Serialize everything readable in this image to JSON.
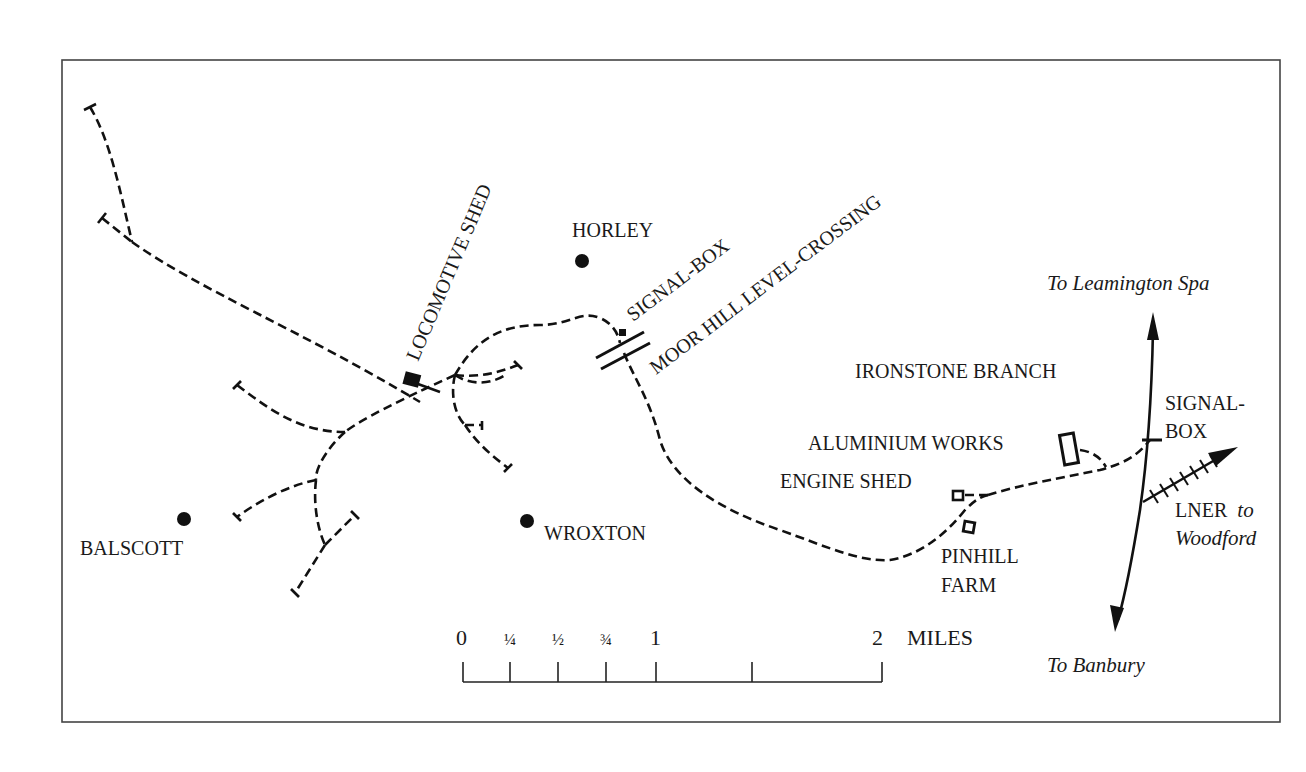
{
  "map": {
    "title_area": "IRONSTONE BRANCH",
    "places": [
      {
        "name": "HORLEY",
        "type": "village"
      },
      {
        "name": "BALSCOTT",
        "type": "village"
      },
      {
        "name": "WROXTON",
        "type": "village"
      }
    ],
    "features": {
      "locomotive_shed": "LOCOMOTIVE SHED",
      "signal_box_moor_hill": "SIGNAL-BOX",
      "level_crossing": "MOOR HILL LEVEL-CROSSING",
      "aluminium_works": "ALUMINIUM WORKS",
      "engine_shed": "ENGINE SHED",
      "pinhill_farm_line1": "PINHILL",
      "pinhill_farm_line2": "FARM",
      "signal_box_junction_line1": "SIGNAL-",
      "signal_box_junction_line2": "BOX"
    },
    "directions": {
      "north": "To Leamington Spa",
      "south": "To Banbury",
      "lner_line1_prefix": "LNER",
      "lner_line1_italic": "to",
      "lner_line2": "Woodford"
    },
    "scale_bar": {
      "unit": "MILES",
      "ticks": [
        "0",
        "¼",
        "½",
        "¾",
        "1",
        "",
        "2"
      ]
    },
    "colors": {
      "ink": "#111111",
      "frame": "#444444",
      "background": "#ffffff"
    }
  }
}
